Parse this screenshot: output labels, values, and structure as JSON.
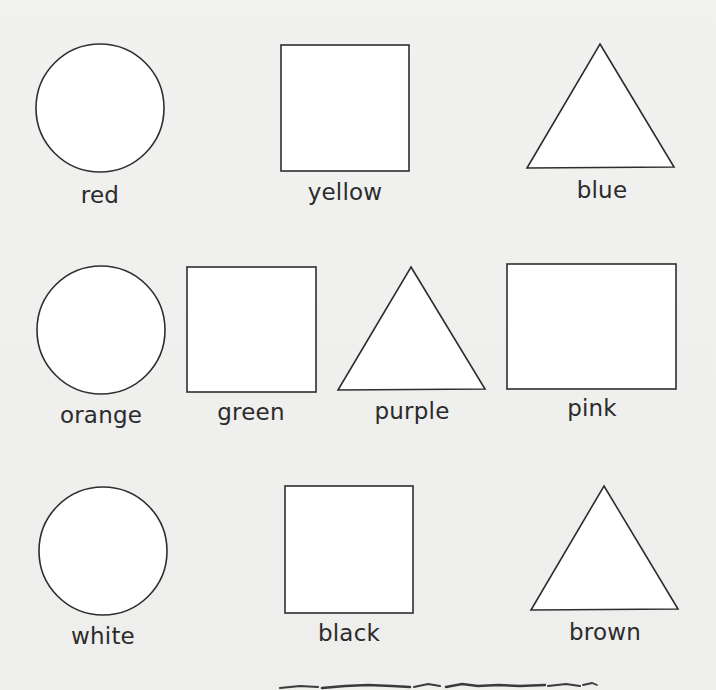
{
  "worksheet": {
    "background_color": "#f0f0ef",
    "stroke_color": "#2e2e2e",
    "fill_color": "#ffffff",
    "rows": [
      {
        "items": [
          {
            "shape": "circle",
            "label": "red"
          },
          {
            "shape": "square",
            "label": "yellow"
          },
          {
            "shape": "triangle",
            "label": "blue"
          }
        ]
      },
      {
        "items": [
          {
            "shape": "circle",
            "label": "orange"
          },
          {
            "shape": "square",
            "label": "green"
          },
          {
            "shape": "triangle",
            "label": "purple"
          },
          {
            "shape": "rectangle",
            "label": "pink"
          }
        ]
      },
      {
        "items": [
          {
            "shape": "circle",
            "label": "white"
          },
          {
            "shape": "square",
            "label": "black"
          },
          {
            "shape": "triangle",
            "label": "brown"
          }
        ]
      }
    ],
    "footer": {
      "decoration": "torn-edge-line"
    }
  }
}
